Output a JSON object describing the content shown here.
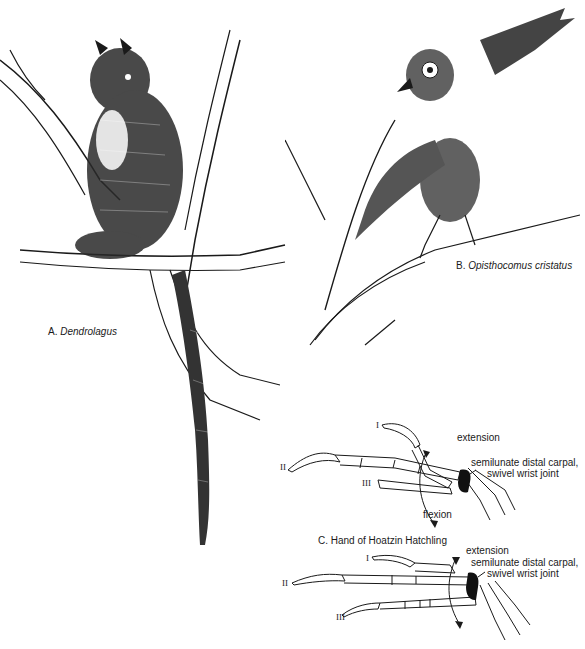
{
  "figure": {
    "panels": [
      {
        "id": "A",
        "caption_prefix": "A.",
        "caption_taxon": "Dendrolagus",
        "subject": "tree kangaroo climbing a branch (pen-and-ink illustration)"
      },
      {
        "id": "B",
        "caption_prefix": "B.",
        "caption_taxon": "Opisthocomus cristatus",
        "subject": "hoatzin hatchling climbing a branch using wing claws (pen-and-ink illustration)"
      },
      {
        "id": "C",
        "caption": "C. Hand of Hoatzin Hatchling",
        "diagrams": [
          {
            "position": "upper",
            "digits": [
              "I",
              "II",
              "III"
            ],
            "motion_labels": [
              "extension",
              "flexion"
            ],
            "joint_label_line1": "semilunate distal carpal,",
            "joint_label_line2": "swivel wrist joint"
          },
          {
            "position": "lower",
            "digits": [
              "I",
              "II",
              "III"
            ],
            "motion_labels": [
              "extension"
            ],
            "joint_label_line1": "semilunate distal carpal,",
            "joint_label_line2": "swivel wrist joint"
          }
        ]
      }
    ],
    "colors": {
      "ink": "#1a1a1a",
      "background": "#ffffff",
      "carpal_fill": "#111111"
    }
  }
}
